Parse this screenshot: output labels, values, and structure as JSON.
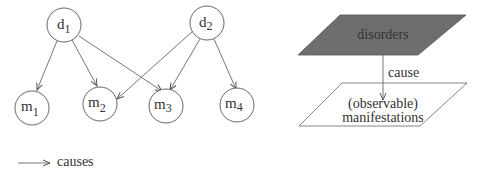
{
  "left_graph": {
    "disorders": [
      {
        "id": "d1",
        "base": "d",
        "sub": "1"
      },
      {
        "id": "d2",
        "base": "d",
        "sub": "2"
      }
    ],
    "manifestations": [
      {
        "id": "m1",
        "base": "m",
        "sub": "1"
      },
      {
        "id": "m2",
        "base": "m",
        "sub": "2"
      },
      {
        "id": "m3",
        "base": "m",
        "sub": "3"
      },
      {
        "id": "m4",
        "base": "m",
        "sub": "4"
      }
    ],
    "edges": [
      [
        "d1",
        "m1"
      ],
      [
        "d1",
        "m2"
      ],
      [
        "d1",
        "m3"
      ],
      [
        "d2",
        "m2"
      ],
      [
        "d2",
        "m3"
      ],
      [
        "d2",
        "m4"
      ]
    ]
  },
  "legend": {
    "label": "causes"
  },
  "right_diagram": {
    "top_plane_label": "disorders",
    "arrow_label": "cause",
    "bottom_plane_label_line1": "(observable)",
    "bottom_plane_label_line2": "manifestations",
    "top_plane_color": "#6e6e6e"
  }
}
